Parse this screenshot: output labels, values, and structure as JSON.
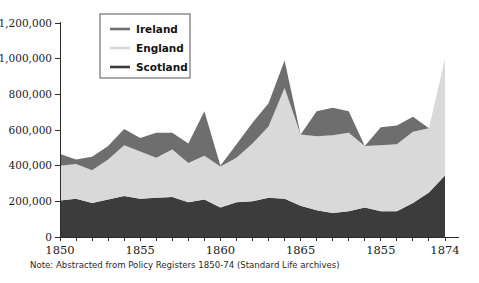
{
  "figure": {
    "note": "Note: Abstracted from Policy Registers 1850-74 (Standard Life archives)",
    "y_axis_prefix_label": "£1,200,000"
  },
  "chart_data": {
    "type": "area",
    "title": "",
    "xlabel": "",
    "ylabel": "",
    "stacked": true,
    "grid": false,
    "legend_position": "top-left",
    "xlim": [
      1850,
      1874
    ],
    "ylim": [
      0,
      1200000
    ],
    "x": [
      1850,
      1851,
      1852,
      1853,
      1854,
      1855,
      1856,
      1857,
      1858,
      1859,
      1860,
      1861,
      1862,
      1863,
      1864,
      1865,
      1866,
      1867,
      1868,
      1869,
      1870,
      1871,
      1872,
      1873,
      1874
    ],
    "xtick_values": [
      1850,
      1855,
      1860,
      1865,
      1870,
      1874
    ],
    "xtick_labels": [
      "1850",
      "1855",
      "1860",
      "1865",
      "1855",
      "1874"
    ],
    "ytick_values": [
      0,
      200000,
      400000,
      600000,
      800000,
      1000000,
      1200000
    ],
    "ytick_labels": [
      "0",
      "200,000",
      "400,000",
      "600,000",
      "800,000",
      "1,000,000",
      "£1,200,000"
    ],
    "series": [
      {
        "name": "Scotland",
        "color": "#3c3c3c",
        "values": [
          205000,
          215000,
          190000,
          210000,
          230000,
          215000,
          220000,
          225000,
          195000,
          210000,
          165000,
          195000,
          200000,
          220000,
          215000,
          175000,
          150000,
          135000,
          145000,
          165000,
          145000,
          145000,
          190000,
          250000,
          345000
        ]
      },
      {
        "name": "England",
        "color": "#d9d9d9",
        "values": [
          195000,
          195000,
          185000,
          225000,
          285000,
          265000,
          225000,
          265000,
          220000,
          245000,
          230000,
          250000,
          325000,
          400000,
          620000,
          400000,
          415000,
          435000,
          440000,
          345000,
          370000,
          375000,
          400000,
          360000,
          655000
        ]
      },
      {
        "name": "Ireland",
        "color": "#6e6e6e",
        "values": [
          65000,
          25000,
          75000,
          75000,
          90000,
          75000,
          140000,
          95000,
          110000,
          250000,
          5000,
          75000,
          115000,
          130000,
          155000,
          0,
          140000,
          155000,
          120000,
          0,
          100000,
          105000,
          85000,
          0,
          0
        ]
      }
    ],
    "legend_entries": [
      {
        "label": "Ireland",
        "color": "#6e6e6e"
      },
      {
        "label": "England",
        "color": "#d9d9d9"
      },
      {
        "label": "Scotland",
        "color": "#3c3c3c"
      }
    ]
  }
}
